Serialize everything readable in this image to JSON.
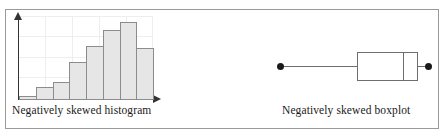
{
  "figure": {
    "border_color": "#9a9a9a",
    "background": "#ffffff"
  },
  "panels": {
    "histogram": {
      "caption": "Negatively skewed histogram",
      "axis_color": "#333333",
      "bar_fill": "#e6e6e6",
      "bar_stroke": "#8c8c8c",
      "grid_color": "#eeeeee"
    },
    "boxplot": {
      "caption": "Negatively skewed boxplot",
      "line_color": "#6e6e6e",
      "dot_color": "#1a1a1a"
    }
  },
  "chart_data": [
    {
      "type": "bar",
      "title": "Negatively skewed histogram",
      "xlabel": "",
      "ylabel": "",
      "grid": true,
      "legend": "none",
      "axis_arrows": true,
      "tick_labels": [],
      "categories": [
        "1",
        "2",
        "3",
        "4",
        "5",
        "6",
        "7",
        "8"
      ],
      "values": [
        4,
        13,
        18,
        38,
        54,
        70,
        78,
        52
      ],
      "ylim": [
        0,
        84
      ],
      "note": "Left tail long, peak near right end then drop - negative skew"
    },
    {
      "type": "boxplot",
      "title": "Negatively skewed boxplot",
      "xlabel": "",
      "ylabel": "",
      "grid": false,
      "legend": "none",
      "orientation": "horizontal",
      "min": 0,
      "q1": 52,
      "median": 83,
      "q3": 93,
      "max": 100,
      "note": "Long left whisker, median near right side of box - negative skew"
    }
  ]
}
